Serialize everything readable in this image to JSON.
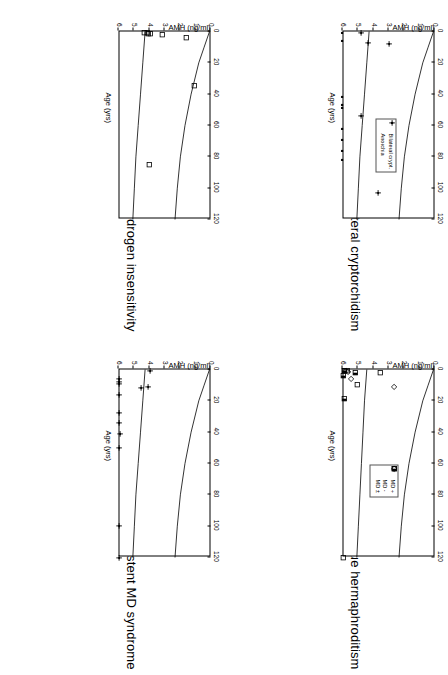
{
  "figure": {
    "axis_titles": {
      "y": "AMH (ng/ml)",
      "x": "Age (yrs)"
    },
    "y_ticks": [
      "0",
      "20",
      "40",
      "60",
      "80",
      "100",
      "120"
    ],
    "x_ticks": [
      "0",
      "1",
      "2",
      "3",
      "4",
      "5",
      "6"
    ]
  },
  "panels": [
    {
      "id": "androgen-insensitivity",
      "title": "Androgen insensitivity",
      "legend": null
    },
    {
      "id": "anorchia-bilateral-cryptorchidism",
      "title": "Anorchia and bilateral cryptorchidism",
      "legend": {
        "items": [
          {
            "marker": "plus",
            "label": "Bilateral crypt."
          },
          {
            "marker": "dot",
            "label": "Anorchia"
          }
        ]
      }
    },
    {
      "id": "persistent-md-syndrome",
      "title": "Persistent MD syndrome",
      "legend": null
    },
    {
      "id": "true-hermaphroditism",
      "title": "True hermaphroditism",
      "legend": {
        "items": [
          {
            "marker": "diamond",
            "label": "MD +"
          },
          {
            "marker": "square",
            "label": "MD -"
          },
          {
            "marker": "halfsquare",
            "label": "MD ±"
          }
        ]
      }
    }
  ],
  "chart_data": [
    {
      "type": "scatter",
      "panel": "androgen-insensitivity",
      "title": "Androgen insensitivity",
      "xlabel": "Age (yrs)",
      "ylabel": "AMH (ng/ml)",
      "xlim": [
        0,
        6
      ],
      "ylim": [
        0,
        120
      ],
      "grid": false,
      "legend_position": "none",
      "series": [
        {
          "name": "Androgen insensitivity",
          "marker": "square",
          "points": [
            {
              "x": 0.05,
              "y": 35
            },
            {
              "x": 0.06,
              "y": 38
            },
            {
              "x": 0.07,
              "y": 42
            },
            {
              "x": 0.08,
              "y": 40
            },
            {
              "x": 0.1,
              "y": 58
            },
            {
              "x": 0.22,
              "y": 90
            },
            {
              "x": 1.75,
              "y": 100
            },
            {
              "x": 4.25,
              "y": 41
            }
          ]
        }
      ],
      "reference_curves": [
        {
          "name": "upper normal limit",
          "points": [
            [
              0,
              120
            ],
            [
              0.5,
              113
            ],
            [
              1,
              106
            ],
            [
              2,
              96
            ],
            [
              3,
              88
            ],
            [
              4,
              82
            ],
            [
              5,
              78
            ],
            [
              6,
              75
            ]
          ]
        },
        {
          "name": "lower normal limit",
          "points": [
            [
              0,
              36
            ],
            [
              1,
              33
            ],
            [
              2,
              30
            ],
            [
              3,
              27
            ],
            [
              4,
              24
            ],
            [
              5,
              22
            ],
            [
              6,
              20
            ]
          ]
        }
      ]
    },
    {
      "type": "scatter",
      "panel": "anorchia-bilateral-cryptorchidism",
      "title": "Anorchia and bilateral cryptorchidism",
      "xlabel": "Age (yrs)",
      "ylabel": "AMH (ng/ml)",
      "xlim": [
        0,
        6
      ],
      "ylim": [
        0,
        120
      ],
      "grid": false,
      "legend_position": "inside-lower-right",
      "series": [
        {
          "name": "Bilateral crypt.",
          "marker": "plus",
          "points": [
            {
              "x": 0.05,
              "y": 26
            },
            {
              "x": 0.35,
              "y": 35
            },
            {
              "x": 0.4,
              "y": 62
            },
            {
              "x": 2.7,
              "y": 25
            },
            {
              "x": 5.15,
              "y": 48
            }
          ]
        },
        {
          "name": "Anorchia",
          "marker": "dot",
          "points": [
            {
              "x": 0.05,
              "y": 1
            },
            {
              "x": 0.3,
              "y": 1
            },
            {
              "x": 2.1,
              "y": 1
            },
            {
              "x": 2.35,
              "y": 1
            },
            {
              "x": 2.45,
              "y": 1
            },
            {
              "x": 3.1,
              "y": 1
            },
            {
              "x": 3.45,
              "y": 1
            },
            {
              "x": 3.8,
              "y": 1
            },
            {
              "x": 4.1,
              "y": 1
            }
          ]
        }
      ],
      "reference_curves": [
        {
          "name": "upper normal limit",
          "points": [
            [
              0,
              120
            ],
            [
              0.5,
              113
            ],
            [
              1,
              106
            ],
            [
              2,
              96
            ],
            [
              3,
              88
            ],
            [
              4,
              82
            ],
            [
              5,
              78
            ],
            [
              6,
              75
            ]
          ]
        },
        {
          "name": "lower normal limit",
          "points": [
            [
              0,
              36
            ],
            [
              1,
              33
            ],
            [
              2,
              30
            ],
            [
              3,
              27
            ],
            [
              4,
              24
            ],
            [
              5,
              22
            ],
            [
              6,
              20
            ]
          ]
        }
      ]
    },
    {
      "type": "scatter",
      "panel": "persistent-md-syndrome",
      "title": "Persistent MD syndrome",
      "xlabel": "Age (yrs)",
      "ylabel": "AMH (ng/ml)",
      "xlim": [
        0,
        6
      ],
      "ylim": [
        0,
        120
      ],
      "grid": false,
      "legend_position": "none",
      "series": [
        {
          "name": "Persistent MD syndrome",
          "marker": "plus",
          "points": [
            {
              "x": 0.05,
              "y": 42
            },
            {
              "x": 0.3,
              "y": 2
            },
            {
              "x": 0.38,
              "y": 2
            },
            {
              "x": 0.45,
              "y": 2
            },
            {
              "x": 0.55,
              "y": 40
            },
            {
              "x": 0.6,
              "y": 31
            },
            {
              "x": 0.8,
              "y": 2
            },
            {
              "x": 1.4,
              "y": 2
            },
            {
              "x": 1.7,
              "y": 2
            },
            {
              "x": 2.05,
              "y": 4
            },
            {
              "x": 2.5,
              "y": 2
            },
            {
              "x": 5.0,
              "y": 2
            },
            {
              "x": 6.0,
              "y": 2
            }
          ]
        }
      ],
      "reference_curves": [
        {
          "name": "upper normal limit",
          "points": [
            [
              0,
              120
            ],
            [
              0.5,
              113
            ],
            [
              1,
              106
            ],
            [
              2,
              96
            ],
            [
              3,
              88
            ],
            [
              4,
              82
            ],
            [
              5,
              78
            ],
            [
              6,
              75
            ]
          ]
        },
        {
          "name": "lower normal limit",
          "points": [
            [
              0,
              36
            ],
            [
              1,
              33
            ],
            [
              2,
              30
            ],
            [
              3,
              27
            ],
            [
              4,
              24
            ],
            [
              5,
              22
            ],
            [
              6,
              20
            ]
          ]
        }
      ]
    },
    {
      "type": "scatter",
      "panel": "true-hermaphroditism",
      "title": "True hermaphroditism",
      "xlabel": "Age (yrs)",
      "ylabel": "AMH (ng/ml)",
      "xlim": [
        0,
        6
      ],
      "ylim": [
        0,
        120
      ],
      "grid": false,
      "legend_position": "inside-lower-right",
      "series": [
        {
          "name": "MD +",
          "marker": "diamond",
          "points": [
            {
              "x": 0.05,
              "y": 6
            },
            {
              "x": 0.07,
              "y": 8
            },
            {
              "x": 0.3,
              "y": 13
            },
            {
              "x": 0.55,
              "y": 68
            }
          ]
        },
        {
          "name": "MD -",
          "marker": "square",
          "points": [
            {
              "x": 0.05,
              "y": 4
            },
            {
              "x": 0.06,
              "y": 7
            },
            {
              "x": 0.12,
              "y": 50
            },
            {
              "x": 0.5,
              "y": 20
            },
            {
              "x": 6.0,
              "y": 2
            }
          ]
        },
        {
          "name": "MD ±",
          "marker": "halfsquare",
          "points": [
            {
              "x": 0.05,
              "y": 3
            },
            {
              "x": 0.1,
              "y": 18
            },
            {
              "x": 0.2,
              "y": 2
            },
            {
              "x": 0.95,
              "y": 3
            }
          ]
        }
      ],
      "reference_curves": [
        {
          "name": "upper normal limit",
          "points": [
            [
              0,
              120
            ],
            [
              0.5,
              113
            ],
            [
              1,
              106
            ],
            [
              2,
              96
            ],
            [
              3,
              88
            ],
            [
              4,
              82
            ],
            [
              5,
              78
            ],
            [
              6,
              75
            ]
          ]
        },
        {
          "name": "lower normal limit",
          "points": [
            [
              0,
              33
            ],
            [
              1,
              30
            ],
            [
              2,
              28
            ],
            [
              3,
              26
            ],
            [
              4,
              24
            ],
            [
              5,
              22
            ],
            [
              6,
              20
            ]
          ]
        }
      ]
    }
  ]
}
